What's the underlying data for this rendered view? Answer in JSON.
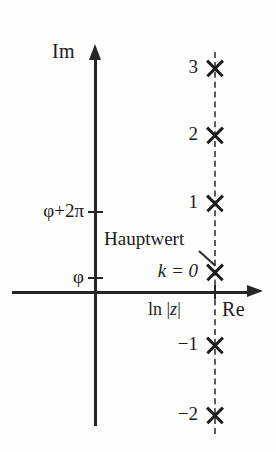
{
  "figure": {
    "background_color": "#fdfdfc",
    "ink_color": "#1c1c1c",
    "dash_color": "#5c5c5c"
  },
  "axes": {
    "imaginary": {
      "label": "Im",
      "icon": "up-arrow-icon"
    },
    "real": {
      "label": "Re",
      "icon": "right-arrow-icon"
    },
    "y_ticks": [
      {
        "label": "φ+2π",
        "name": "phi-plus-2pi"
      },
      {
        "label": "φ",
        "name": "phi"
      }
    ]
  },
  "annotations": {
    "hauptwert": "Hauptwert",
    "principal_branch": "k = 0",
    "ln_modulus_prefix": "ln |",
    "ln_modulus_var": "z",
    "ln_modulus_suffix": "|"
  },
  "chart_data": {
    "type": "scatter",
    "xlabel": "Re",
    "ylabel": "Im",
    "grid": false,
    "legend": "none",
    "x_annotation": "ln |z|",
    "series": [
      {
        "name": "branches",
        "marker": "x",
        "points": [
          {
            "k": "3",
            "label": "3",
            "x": "ln |z|",
            "y": "φ+6π"
          },
          {
            "k": "2",
            "label": "2",
            "x": "ln |z|",
            "y": "φ+4π"
          },
          {
            "k": "1",
            "label": "1",
            "x": "ln |z|",
            "y": "φ+2π"
          },
          {
            "k": "0",
            "label": "k = 0",
            "x": "ln |z|",
            "y": "φ",
            "note": "Hauptwert"
          },
          {
            "k": "-1",
            "label": "−1",
            "x": "ln |z|",
            "y": "φ−2π"
          },
          {
            "k": "-2",
            "label": "−2",
            "x": "ln |z|",
            "y": "φ−4π"
          }
        ]
      }
    ],
    "locus": {
      "style": "dashed-vertical",
      "description": "Vertical dashed line at Re = ln |z| through all branch points"
    }
  }
}
